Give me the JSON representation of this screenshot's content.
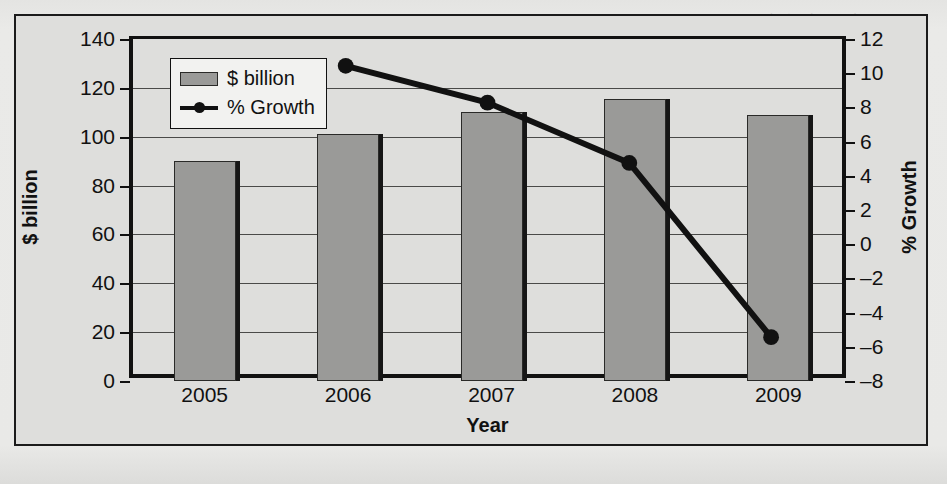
{
  "figure": {
    "legend": [
      {
        "label": "$ billion",
        "marker": "bar-swatch"
      },
      {
        "label": "% Growth",
        "marker": "line-marker-swatch"
      }
    ]
  },
  "background_text": {
    "lines": [
      {
        "text": "consumer electronics, and",
        "x": 700,
        "y": 8
      },
      {
        "text": "equipment and entertainment consoles",
        "x": 640,
        "y": 27
      },
      {
        "text": "markets.",
        "x": 700,
        "y": 46
      },
      {
        "text": "Global semiconductor revenue is",
        "x": 660,
        "y": 84
      },
      {
        "text": "expected to decline in 2009 as the",
        "x": 655,
        "y": 103
      },
      {
        "text": "worldwide economic downturn",
        "x": 662,
        "y": 122
      },
      {
        "text": "reduces demand for electronic",
        "x": 660,
        "y": 160
      },
      {
        "text": "products. Revenues are projected to",
        "x": 650,
        "y": 179
      },
      {
        "text": "return to growth in 2010.",
        "x": 668,
        "y": 198
      },
      {
        "text": "Market Trends",
        "x": 648,
        "y": 236
      },
      {
        "text": "The semiconductor industry is a",
        "x": 652,
        "y": 272
      },
      {
        "text": "key industry for the US economy.",
        "x": 648,
        "y": 291
      },
      {
        "text": "Demand growth is driven by",
        "x": 658,
        "y": 310
      },
      {
        "text": "innovation across end markets.",
        "x": 650,
        "y": 329
      }
    ]
  },
  "chart_data": {
    "type": "bar",
    "title": "",
    "xlabel": "Year",
    "categories": [
      "2005",
      "2006",
      "2007",
      "2008",
      "2009"
    ],
    "grid": true,
    "legend_position": "top-left-inside",
    "axes": {
      "left": {
        "label": "$ billion",
        "ylim": [
          0,
          140
        ],
        "tick_step": 20,
        "ticks": [
          0,
          20,
          40,
          60,
          80,
          100,
          120,
          140
        ]
      },
      "right": {
        "label": "% Growth",
        "ylim": [
          -8,
          12
        ],
        "tick_step": 2,
        "ticks": [
          -8,
          -6,
          -4,
          -2,
          0,
          2,
          4,
          6,
          8,
          10,
          12
        ]
      }
    },
    "series": [
      {
        "name": "$ billion",
        "type": "bar",
        "axis": "left",
        "color": "#9a9a98",
        "values": [
          90,
          101,
          110,
          115.5,
          109
        ]
      },
      {
        "name": "% Growth",
        "type": "line",
        "axis": "right",
        "color": "#111111",
        "values": [
          null,
          10.4,
          8.2,
          4.6,
          -5.8
        ]
      }
    ]
  }
}
